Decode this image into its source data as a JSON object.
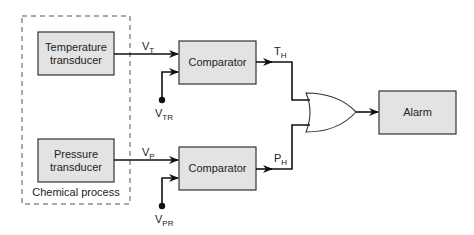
{
  "diagram": {
    "boundary": {
      "label": "Chemical process"
    },
    "blocks": {
      "temperature_transducer": {
        "line1": "Temperature",
        "line2": "transducer"
      },
      "pressure_transducer": {
        "line1": "Pressure",
        "line2": "transducer"
      },
      "comparator_top": {
        "label": "Comparator"
      },
      "comparator_bottom": {
        "label": "Comparator"
      },
      "alarm": {
        "label": "Alarm"
      }
    },
    "signals": {
      "vt": {
        "main": "V",
        "sub": "T"
      },
      "vtr": {
        "main": "V",
        "sub": "TR"
      },
      "vp": {
        "main": "V",
        "sub": "P"
      },
      "vpr": {
        "main": "V",
        "sub": "PR"
      },
      "th": {
        "main": "T",
        "sub": "H"
      },
      "ph": {
        "main": "P",
        "sub": "H"
      }
    },
    "gate": {
      "type": "OR"
    },
    "colors": {
      "block_fill": "#e3e3e3",
      "stroke": "#333333",
      "wire": "#111111"
    }
  }
}
